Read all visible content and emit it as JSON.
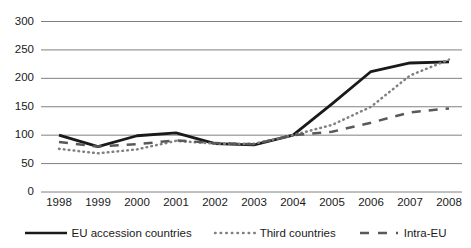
{
  "chart_data": {
    "type": "line",
    "title": "",
    "subtitle": "",
    "xlabel": "",
    "ylabel": "",
    "categories": [
      "1998",
      "1999",
      "2000",
      "2001",
      "2002",
      "2003",
      "2004",
      "2005",
      "2006",
      "2007",
      "2008"
    ],
    "ylim": [
      0,
      300
    ],
    "y_ticks": [
      "0",
      "50",
      "100",
      "150",
      "200",
      "250",
      "300"
    ],
    "y_tick_values": [
      0,
      50,
      100,
      150,
      200,
      250,
      300
    ],
    "grid": true,
    "legend_position": "bottom",
    "series": [
      {
        "name": "EU accession countries",
        "style": "solid",
        "color": "#1a1a1a",
        "values": [
          100,
          80,
          99,
          104,
          85,
          83,
          100,
          155,
          212,
          227,
          229
        ]
      },
      {
        "name": "Third countries",
        "style": "dotted",
        "color": "#808080",
        "values": [
          76,
          68,
          75,
          90,
          85,
          85,
          100,
          118,
          150,
          205,
          233
        ]
      },
      {
        "name": "Intra-EU",
        "style": "dashed",
        "color": "#595959",
        "values": [
          88,
          80,
          84,
          91,
          86,
          84,
          100,
          106,
          122,
          140,
          147
        ]
      }
    ]
  },
  "legend": {
    "items": [
      {
        "label": "EU accession countries",
        "style": "solid"
      },
      {
        "label": "Third countries",
        "style": "dotted"
      },
      {
        "label": "Intra-EU",
        "style": "dashed"
      }
    ]
  },
  "colors": {
    "grid": "#808080",
    "axis_text": "#1a1a1a",
    "solid_series": "#1a1a1a",
    "dotted_series": "#808080",
    "dashed_series": "#595959",
    "background": "#ffffff"
  }
}
